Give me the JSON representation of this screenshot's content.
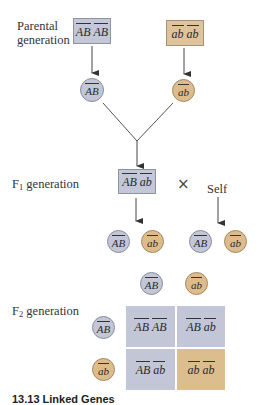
{
  "labels": {
    "parental_line1": "Parental",
    "parental_line2": "generation",
    "f1_prefix": "F",
    "f1_sub": "1",
    "f1_suffix": " generation",
    "f2_prefix": "F",
    "f2_sub": "2",
    "f2_suffix": " generation",
    "cross_symbol": "×",
    "self_label": "Self",
    "caption": "13.13  Linked Genes"
  },
  "colors": {
    "dominant_fill": "#c4c7d7",
    "recessive_fill": "#dec39d",
    "line": "#444444"
  },
  "parental": {
    "left": {
      "allele1": "AB",
      "allele2": "AB",
      "type": "dominant"
    },
    "right": {
      "allele1": "ab",
      "allele2": "ab",
      "type": "recessive"
    }
  },
  "parental_gametes": [
    {
      "allele": "AB",
      "type": "dominant"
    },
    {
      "allele": "ab",
      "type": "recessive"
    }
  ],
  "f1": {
    "allele1": "AB",
    "allele2": "ab",
    "type": "dominant"
  },
  "f1_gametes": [
    {
      "allele": "AB",
      "type": "dominant"
    },
    {
      "allele": "ab",
      "type": "recessive"
    },
    {
      "allele": "AB",
      "type": "dominant"
    },
    {
      "allele": "ab",
      "type": "recessive"
    }
  ],
  "punnett": {
    "column_headers": [
      {
        "allele": "AB",
        "type": "dominant"
      },
      {
        "allele": "ab",
        "type": "recessive"
      }
    ],
    "row_headers": [
      {
        "allele": "AB",
        "type": "dominant"
      },
      {
        "allele": "ab",
        "type": "recessive"
      }
    ],
    "cells": [
      [
        {
          "allele1": "AB",
          "allele2": "AB",
          "type": "dominant"
        },
        {
          "allele1": "AB",
          "allele2": "ab",
          "type": "dominant"
        }
      ],
      [
        {
          "allele1": "AB",
          "allele2": "ab",
          "type": "dominant"
        },
        {
          "allele1": "ab",
          "allele2": "ab",
          "type": "recessive"
        }
      ]
    ]
  }
}
